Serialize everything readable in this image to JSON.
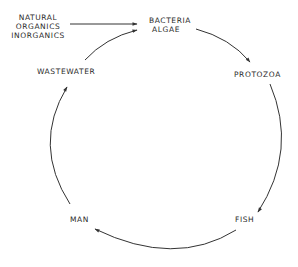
{
  "diagram": {
    "type": "cycle",
    "stroke_color": "#333333",
    "background": "#ffffff",
    "inputs": {
      "lines": [
        "NATURAL",
        "ORGANICS",
        "INORGANICS"
      ]
    },
    "nodes": {
      "bacteria_algae": {
        "lines": [
          "BACTERIA",
          "ALGAE"
        ]
      },
      "protozoa": {
        "label": "PROTOZOA"
      },
      "fish": {
        "label": "FISH"
      },
      "man": {
        "label": "MAN"
      },
      "wastewater": {
        "label": "WASTEWATER"
      }
    },
    "edges": [
      {
        "from": "NATURAL ORGANICS INORGANICS",
        "to": "BACTERIA ALGAE"
      },
      {
        "from": "BACTERIA ALGAE",
        "to": "PROTOZOA"
      },
      {
        "from": "PROTOZOA",
        "to": "FISH"
      },
      {
        "from": "FISH",
        "to": "MAN"
      },
      {
        "from": "MAN",
        "to": "WASTEWATER"
      },
      {
        "from": "WASTEWATER",
        "to": "BACTERIA ALGAE"
      }
    ]
  }
}
